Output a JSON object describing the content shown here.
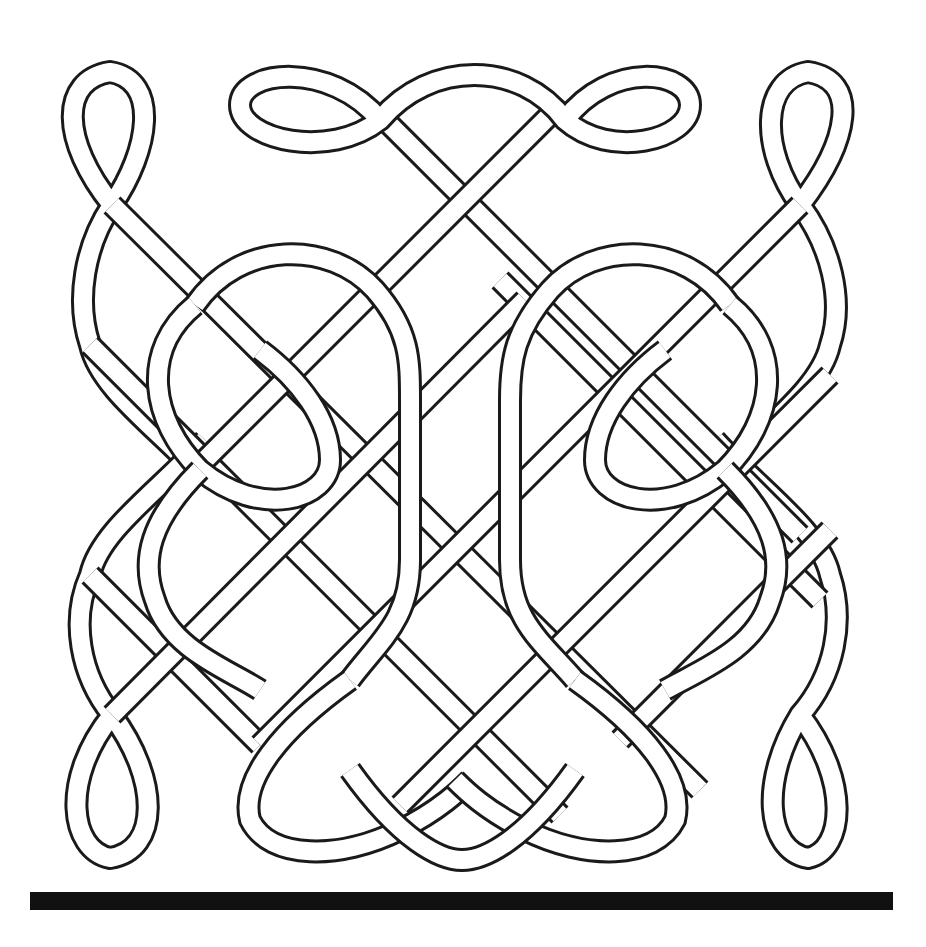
{
  "figure": {
    "colors": {
      "line": "#1a1a1a",
      "fill": "#ffffff",
      "bar": "#111111"
    }
  },
  "bar": {
    "label": "base bar"
  }
}
